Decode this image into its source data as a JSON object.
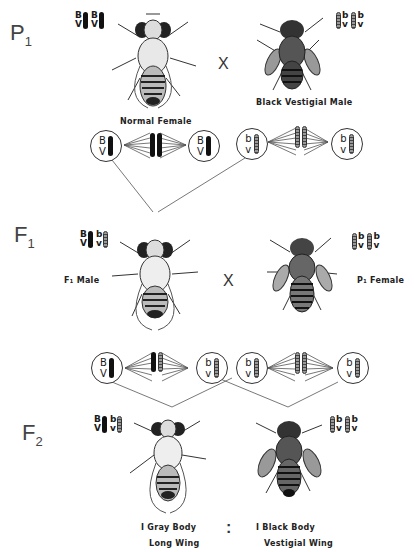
{
  "generations": {
    "p1": {
      "label": "P",
      "sub": "1",
      "female": {
        "caption": "Normal   Female",
        "genotype": [
          {
            "top": "B",
            "bottom": "V",
            "type": "dominant"
          },
          {
            "top": "B",
            "bottom": "V",
            "type": "dominant"
          }
        ]
      },
      "cross_symbol": "X",
      "male": {
        "caption": "Black   Vestigial Male",
        "genotype": [
          {
            "top": "b",
            "bottom": "v",
            "type": "recessive"
          },
          {
            "top": "b",
            "bottom": "v",
            "type": "recessive"
          }
        ]
      },
      "gametes_left": {
        "top": "B",
        "bottom": "V",
        "type": "dominant"
      },
      "gametes_right": {
        "top": "b",
        "bottom": "v",
        "type": "recessive"
      }
    },
    "f1_note": {
      "line1": "F₁ Male   crossed   with",
      "line2": "double  recessive   female"
    },
    "f1": {
      "label": "F",
      "sub": "1",
      "male": {
        "caption": "F₁   Male",
        "genotype": [
          {
            "top": "B",
            "bottom": "V",
            "type": "dominant"
          },
          {
            "top": "b",
            "bottom": "v",
            "type": "recessive"
          }
        ]
      },
      "cross_symbol": "X",
      "female": {
        "caption": "P₁   Female",
        "genotype": [
          {
            "top": "b",
            "bottom": "v",
            "type": "recessive"
          },
          {
            "top": "b",
            "bottom": "v",
            "type": "recessive"
          }
        ]
      },
      "gametes": [
        {
          "top": "B",
          "bottom": "V",
          "type": "dominant"
        },
        {
          "top": "b",
          "bottom": "v",
          "type": "recessive"
        },
        {
          "top": "b",
          "bottom": "v",
          "type": "recessive"
        },
        {
          "top": "b",
          "bottom": "v",
          "type": "recessive"
        }
      ]
    },
    "f2": {
      "label": "F",
      "sub": "2",
      "left": {
        "caption_line1": "I  Gray  Body",
        "caption_line2": "Long  Wing",
        "genotype": [
          {
            "top": "B",
            "bottom": "V",
            "type": "dominant"
          },
          {
            "top": "b",
            "bottom": "v",
            "type": "recessive"
          }
        ]
      },
      "ratio_symbol": ":",
      "right": {
        "caption_line1": "I  Black  Body",
        "caption_line2": "Vestigial  Wing",
        "genotype": [
          {
            "top": "b",
            "bottom": "v",
            "type": "recessive"
          },
          {
            "top": "b",
            "bottom": "v",
            "type": "recessive"
          }
        ]
      }
    }
  }
}
